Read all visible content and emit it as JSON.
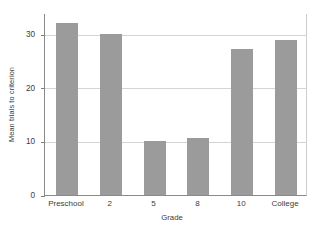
{
  "chart_data": {
    "type": "bar",
    "title": "",
    "xlabel": "Grade",
    "ylabel": "Mean trials to criterion",
    "categories": [
      "Preschool",
      "2",
      "5",
      "8",
      "10",
      "College"
    ],
    "values": [
      32.2,
      30.0,
      10.1,
      10.7,
      27.2,
      28.9
    ],
    "ylim": [
      0,
      34
    ],
    "yticks": [
      0,
      10,
      20,
      30
    ],
    "ytick_labels": [
      "0",
      "10",
      "20",
      "30"
    ],
    "grid": true,
    "legend": null,
    "series": [
      {
        "name": "Mean trials to criterion",
        "values": [
          32.2,
          30.0,
          10.1,
          10.7,
          27.2,
          28.9
        ]
      }
    ],
    "bar_color": "#9b9b9b",
    "background_color": "#ffffff",
    "gridline_color": "#d4d4d4",
    "axis_color": "#8a8a8a",
    "text_color": "#3c3c3c"
  }
}
